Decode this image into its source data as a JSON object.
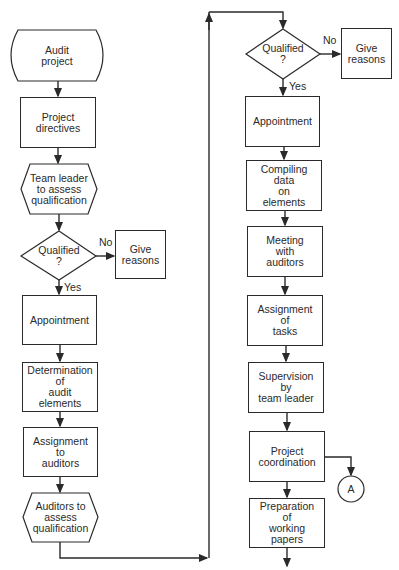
{
  "diagram": {
    "type": "flowchart",
    "left_column": {
      "start": "Audit\nproject",
      "directives": "Project\ndirectives",
      "leader_assess": "Team leader\nto assess\nqualification",
      "decision": "Qualified\n?",
      "decision_no_label": "No",
      "decision_yes_label": "Yes",
      "no_result": "Give\nreasons",
      "appointment": "Appointment",
      "determination": "Determination\nof\naudit\nelements",
      "assignment_auditors": "Assignment\nto\nauditors",
      "auditors_assess": "Auditors to\nassess\nqualification"
    },
    "right_column": {
      "decision": "Qualified\n?",
      "decision_no_label": "No",
      "decision_yes_label": "Yes",
      "no_result": "Give\nreasons",
      "appointment": "Appointment",
      "compiling": "Compiling\ndata\non\nelements",
      "meeting": "Meeting\nwith\nauditors",
      "assignment_tasks": "Assignment\nof\ntasks",
      "supervision": "Supervision\nby\nteam leader",
      "coordination": "Project\ncoordination",
      "connector": "A",
      "preparation": "Preparation\nof\nworking\npapers"
    },
    "colors": {
      "line": "#2a2a2a",
      "background": "#ffffff"
    }
  }
}
